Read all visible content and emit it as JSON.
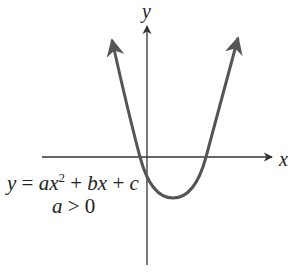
{
  "diagram": {
    "type": "parabola-graph",
    "axes": {
      "x_label": "x",
      "y_label": "y"
    },
    "equation": {
      "lhs": "y",
      "eq": " = ",
      "a": "a",
      "x1": "x",
      "exp": "2",
      "plus1": " + ",
      "b": "b",
      "x2": "x",
      "plus2": " + ",
      "c": "c"
    },
    "condition": {
      "var": "a",
      "rel": " > ",
      "val": "0"
    },
    "colors": {
      "curve": "#555555",
      "axes": "#333333",
      "text": "#222222"
    }
  }
}
